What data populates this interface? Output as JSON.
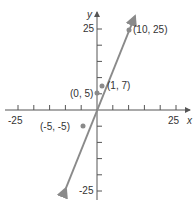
{
  "equation_label": "y = 2x + 5",
  "colors": {
    "line": "#8a8a8a",
    "axis": "#555555",
    "text": "#333333"
  },
  "chart_data": {
    "type": "line",
    "xlabel": "x",
    "ylabel": "y",
    "xlim": [
      -25,
      25
    ],
    "ylim": [
      -25,
      25
    ],
    "x_tick_labels": [
      "-25",
      "25"
    ],
    "y_tick_labels": [
      "25",
      "-25"
    ],
    "tick_step": 5,
    "series": [
      {
        "name": "y = 2x + 5",
        "x": [
          -15,
          12
        ],
        "y": [
          -25,
          29
        ]
      }
    ],
    "points": [
      {
        "x": 10,
        "y": 25,
        "label": "(10, 25)"
      },
      {
        "x": 1,
        "y": 7,
        "label": "(1, 7)"
      },
      {
        "x": 0,
        "y": 5,
        "label": "(0, 5)"
      },
      {
        "x": -5,
        "y": -5,
        "label": "(-5, -5)"
      }
    ]
  }
}
